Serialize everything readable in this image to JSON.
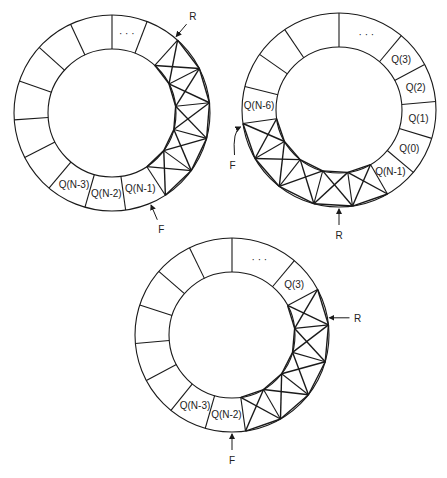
{
  "figure": {
    "stroke_color": "#1a1a1a",
    "background": "#ffffff"
  },
  "rings": [
    {
      "id": "ring-1",
      "cx": 112,
      "cy": 113,
      "r_outer": 98,
      "r_inner": 64,
      "boundaries": [
        0,
        21,
        42,
        63,
        84,
        105,
        126,
        147,
        172,
        196,
        220,
        243,
        266,
        289,
        312,
        335
      ],
      "segments": [
        {
          "label": "· · ·",
          "hatched": false
        },
        {
          "label": "",
          "hatched": false,
          "dots": true
        },
        {
          "label": "",
          "hatched": true
        },
        {
          "label": "",
          "hatched": true
        },
        {
          "label": "",
          "hatched": true
        },
        {
          "label": "",
          "hatched": true
        },
        {
          "label": "",
          "hatched": true
        },
        {
          "label": "Q(N-1)",
          "hatched": false
        },
        {
          "label": "Q(N-2)",
          "hatched": false
        },
        {
          "label": "Q(N-3)",
          "hatched": false
        },
        {
          "label": "",
          "hatched": false
        },
        {
          "label": "",
          "hatched": false
        },
        {
          "label": "",
          "hatched": false
        },
        {
          "label": "",
          "hatched": false
        },
        {
          "label": "",
          "hatched": false
        },
        {
          "label": "",
          "hatched": false
        }
      ],
      "pointers": [
        {
          "name": "R",
          "angle": 40,
          "dir": "in",
          "label_dx": 8,
          "label_dy": -14
        },
        {
          "name": "F",
          "angle": 157,
          "dir": "in",
          "label_dx": 12,
          "label_dy": 14
        }
      ]
    },
    {
      "id": "ring-2",
      "cx": 339,
      "cy": 110,
      "r_outer": 97,
      "r_inner": 63,
      "boundaries": [
        0,
        40,
        62,
        85,
        107,
        130,
        150,
        172,
        195,
        218,
        240,
        262,
        284,
        305,
        326
      ],
      "segments": [
        {
          "label": "· · ·",
          "hatched": false
        },
        {
          "label": "Q(3)",
          "hatched": false
        },
        {
          "label": "Q(2)",
          "hatched": false
        },
        {
          "label": "Q(1)",
          "hatched": false
        },
        {
          "label": "Q(0)",
          "hatched": false
        },
        {
          "label": "Q(N-1)",
          "hatched": false
        },
        {
          "label": "",
          "hatched": true
        },
        {
          "label": "",
          "hatched": true
        },
        {
          "label": "",
          "hatched": true
        },
        {
          "label": "",
          "hatched": true
        },
        {
          "label": "",
          "hatched": true
        },
        {
          "label": "Q(N-6)",
          "hatched": false
        },
        {
          "label": "",
          "hatched": false
        },
        {
          "label": "",
          "hatched": false
        },
        {
          "label": "",
          "hatched": false
        }
      ],
      "pointers": [
        {
          "name": "R",
          "angle": 180,
          "dir": "in",
          "label_dx": 0,
          "label_dy": 18
        },
        {
          "name": "F",
          "angle": 270,
          "dir": "curve",
          "label_dx": -12,
          "label_dy": 36
        }
      ]
    },
    {
      "id": "ring-3",
      "cx": 232,
      "cy": 335,
      "r_outer": 97,
      "r_inner": 63,
      "boundaries": [
        0,
        40,
        62,
        84,
        106,
        128,
        150,
        172,
        196,
        219,
        242,
        265,
        288,
        311,
        334
      ],
      "segments": [
        {
          "label": "· · ·",
          "hatched": false
        },
        {
          "label": "Q(3)",
          "hatched": false
        },
        {
          "label": "",
          "hatched": true
        },
        {
          "label": "",
          "hatched": true
        },
        {
          "label": "",
          "hatched": true
        },
        {
          "label": "",
          "hatched": true
        },
        {
          "label": "",
          "hatched": true
        },
        {
          "label": "Q(N-2)",
          "hatched": false
        },
        {
          "label": "Q(N-3)",
          "hatched": false
        },
        {
          "label": "",
          "hatched": false
        },
        {
          "label": "",
          "hatched": false
        },
        {
          "label": "",
          "hatched": false
        },
        {
          "label": "",
          "hatched": false
        },
        {
          "label": "",
          "hatched": false
        },
        {
          "label": "",
          "hatched": false
        }
      ],
      "pointers": [
        {
          "name": "R",
          "angle": 80,
          "dir": "horiz",
          "label_dx": 24,
          "label_dy": 0
        },
        {
          "name": "F",
          "angle": 180,
          "dir": "in",
          "label_dx": 0,
          "label_dy": 18
        }
      ]
    }
  ],
  "labels": {
    "ring1": {
      "r": "R",
      "f": "F"
    },
    "ring2": {
      "r": "R",
      "f": "F"
    },
    "ring3": {
      "r": "R",
      "f": "F"
    }
  }
}
